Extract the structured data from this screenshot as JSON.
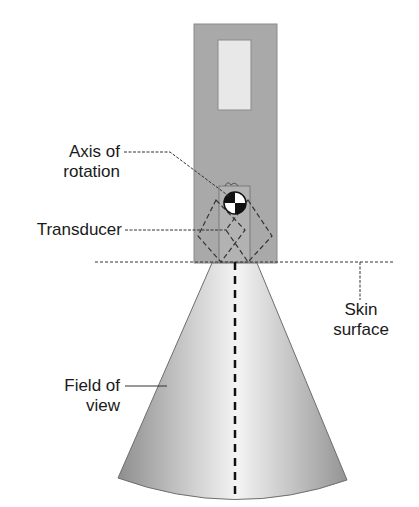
{
  "diagram": {
    "title": "",
    "labels": {
      "axis_of_rotation": [
        "Axis of",
        "rotation"
      ],
      "transducer": "Transducer",
      "skin_surface": [
        "Skin",
        "surface"
      ],
      "field_of_view": [
        "Field of",
        "view"
      ]
    },
    "colors": {
      "housing": "#a8a8a8",
      "window": "#e6e6e6",
      "beam_edge": "#9a9a9a",
      "beam_center": "#f2f2f2",
      "line": "#333333"
    }
  }
}
